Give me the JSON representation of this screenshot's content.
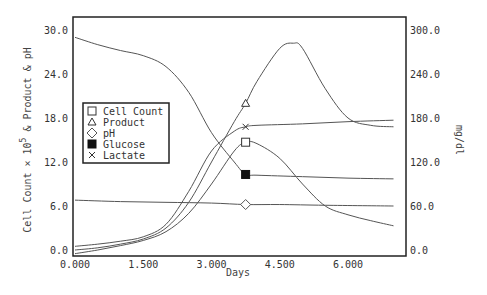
{
  "chart_data": {
    "type": "line",
    "title": "",
    "xlabel": "Days",
    "ylabel": "Cell Count × 10^5 & Product & pH",
    "ylabel_parts": {
      "pre": "Cell Count × 10",
      "sup": "5",
      "post": " & Product & pH"
    },
    "y2label": "mg/dl",
    "xlim": [
      0,
      7.3
    ],
    "ylim": [
      0,
      30
    ],
    "y2lim": [
      0,
      300
    ],
    "x_ticks": [
      "0.000",
      "1.500",
      "3.000",
      "4.500",
      "6.000"
    ],
    "x_tick_values": [
      0,
      1.5,
      3.0,
      4.5,
      6.0
    ],
    "y_ticks": [
      "0.0",
      "6.0",
      "12.0",
      "18.0",
      "24.0",
      "30.0"
    ],
    "y_tick_values": [
      0,
      6,
      12,
      18,
      24,
      30
    ],
    "y2_ticks": [
      "0.0",
      "60.0",
      "120.0",
      "180.0",
      "240.0",
      "300.0"
    ],
    "y2_tick_values": [
      0,
      60,
      120,
      180,
      240,
      300
    ],
    "grid": false,
    "legend_position": "left-middle inside",
    "marker_x": 3.75,
    "series": [
      {
        "name": "Cell Count",
        "marker": "open-square",
        "axis": "left",
        "x": [
          0,
          0.5,
          1.0,
          1.5,
          2.0,
          2.5,
          3.0,
          3.5,
          3.75,
          4.0,
          4.5,
          5.0,
          5.5,
          6.0,
          6.5,
          7.0
        ],
        "y": [
          -0.5,
          0.0,
          0.6,
          1.3,
          2.5,
          5.0,
          9.0,
          13.5,
          14.7,
          14.5,
          12.5,
          9.0,
          6.0,
          4.8,
          4.0,
          3.3
        ]
      },
      {
        "name": "Product",
        "marker": "open-triangle",
        "axis": "left",
        "x": [
          0,
          0.5,
          1.0,
          1.5,
          2.0,
          2.5,
          3.0,
          3.5,
          3.75,
          4.0,
          4.5,
          4.8,
          5.0,
          5.5,
          6.0,
          6.5,
          7.0
        ],
        "y": [
          0.0,
          0.3,
          0.8,
          1.5,
          3.0,
          6.5,
          12.0,
          17.5,
          20.0,
          23.0,
          27.5,
          28.2,
          27.5,
          22.0,
          18.0,
          17.0,
          16.8
        ]
      },
      {
        "name": "pH",
        "marker": "open-diamond",
        "axis": "left",
        "x": [
          0,
          1.0,
          2.0,
          3.0,
          3.75,
          4.5,
          5.5,
          7.0
        ],
        "y": [
          6.8,
          6.6,
          6.5,
          6.4,
          6.2,
          6.2,
          6.1,
          6.0
        ]
      },
      {
        "name": "Glucose",
        "marker": "filled-square",
        "axis": "right",
        "x": [
          0,
          0.5,
          1.0,
          1.5,
          2.0,
          2.5,
          3.0,
          3.5,
          3.75,
          4.0,
          5.0,
          6.0,
          7.0
        ],
        "y": [
          290,
          280,
          272,
          265,
          250,
          215,
          160,
          120,
          103,
          102,
          100,
          98,
          97
        ]
      },
      {
        "name": "Lactate",
        "marker": "x",
        "axis": "right",
        "x": [
          0,
          0.5,
          1.0,
          1.5,
          2.0,
          2.5,
          3.0,
          3.5,
          3.75,
          4.0,
          5.0,
          6.0,
          7.0
        ],
        "y": [
          5,
          8,
          12,
          18,
          35,
          80,
          135,
          162,
          168,
          170,
          172,
          175,
          177
        ]
      }
    ]
  }
}
